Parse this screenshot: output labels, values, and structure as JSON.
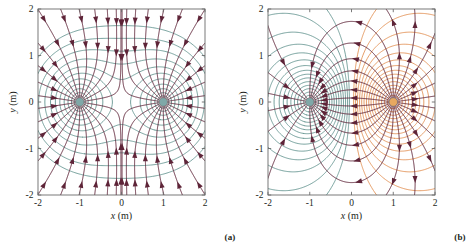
{
  "figure": {
    "background": "#ffffff",
    "width": 460,
    "height": 252
  },
  "panels": [
    {
      "id": "a",
      "caption": "(a)",
      "configuration": "two equal negative point charges",
      "xlabel": "x (m)",
      "ylabel": "y (m)",
      "xlabel_var": "x",
      "xlabel_unit": "(m)",
      "ylabel_var": "y",
      "ylabel_unit": "(m)",
      "xticks": [
        "-2",
        "-1",
        "0",
        "1",
        "2"
      ],
      "yticks": [
        "2",
        "1",
        "0",
        "-1",
        "-2"
      ],
      "xtick_values": [
        -2,
        -1,
        0,
        1,
        2
      ],
      "ytick_values": [
        2,
        1,
        0,
        -1,
        -2
      ],
      "xlim": [
        -2,
        2
      ],
      "ylim": [
        -2,
        2
      ],
      "charges": [
        {
          "name": "negative-charge-left",
          "x": -1,
          "y": 0,
          "q": -1,
          "color": "#7fa8a8"
        },
        {
          "name": "negative-charge-right",
          "x": 1,
          "y": 0,
          "q": -1,
          "color": "#7fa8a8"
        }
      ],
      "fieldline_color": "#5e2438",
      "equipotential_colors": [
        "#5c8f8a"
      ],
      "arrow_direction": "inward",
      "frame_color": "#6b6b6b"
    },
    {
      "id": "b",
      "caption": "(b)",
      "configuration": "electric dipole: one negative and one positive point charge",
      "xlabel": "x (m)",
      "ylabel": "y (m)",
      "xlabel_var": "x",
      "xlabel_unit": "(m)",
      "ylabel_var": "y",
      "ylabel_unit": "(m)",
      "xticks": [
        "-2",
        "-1",
        "0",
        "1",
        "2"
      ],
      "yticks": [
        "2",
        "1",
        "0",
        "-1",
        "-2"
      ],
      "xtick_values": [
        -2,
        -1,
        0,
        1,
        2
      ],
      "ytick_values": [
        2,
        1,
        0,
        -1,
        -2
      ],
      "xlim": [
        -2,
        2
      ],
      "ylim": [
        -2,
        2
      ],
      "charges": [
        {
          "name": "negative-charge-left",
          "x": -1,
          "y": 0,
          "q": -1,
          "color": "#7fa8a8"
        },
        {
          "name": "positive-charge-right",
          "x": 1,
          "y": 0,
          "q": 1,
          "color": "#e8a860"
        }
      ],
      "fieldline_color": "#5e2438",
      "equipotential_colors": [
        "#5c8f8a",
        "#e08a4a"
      ],
      "arrow_direction": "from-positive-to-negative",
      "frame_color": "#6b6b6b"
    }
  ],
  "chart_data": {
    "type": "line",
    "title": "",
    "xlabel": "x (m)",
    "ylabel": "y (m)",
    "xlim": [
      -2,
      2
    ],
    "ylim": [
      -2,
      2
    ],
    "grid": false,
    "legend": "none",
    "series": [
      {
        "name": "field-lines-panel-a",
        "style": "field-lines-with-arrows",
        "color": "#5e2438"
      },
      {
        "name": "equipotentials-panel-a",
        "style": "contour",
        "color": "#5c8f8a"
      },
      {
        "name": "field-lines-panel-b",
        "style": "field-lines-with-arrows",
        "color": "#5e2438"
      },
      {
        "name": "equipotentials-panel-b-negative",
        "style": "contour",
        "color": "#5c8f8a"
      },
      {
        "name": "equipotentials-panel-b-positive",
        "style": "contour",
        "color": "#e08a4a"
      }
    ]
  }
}
